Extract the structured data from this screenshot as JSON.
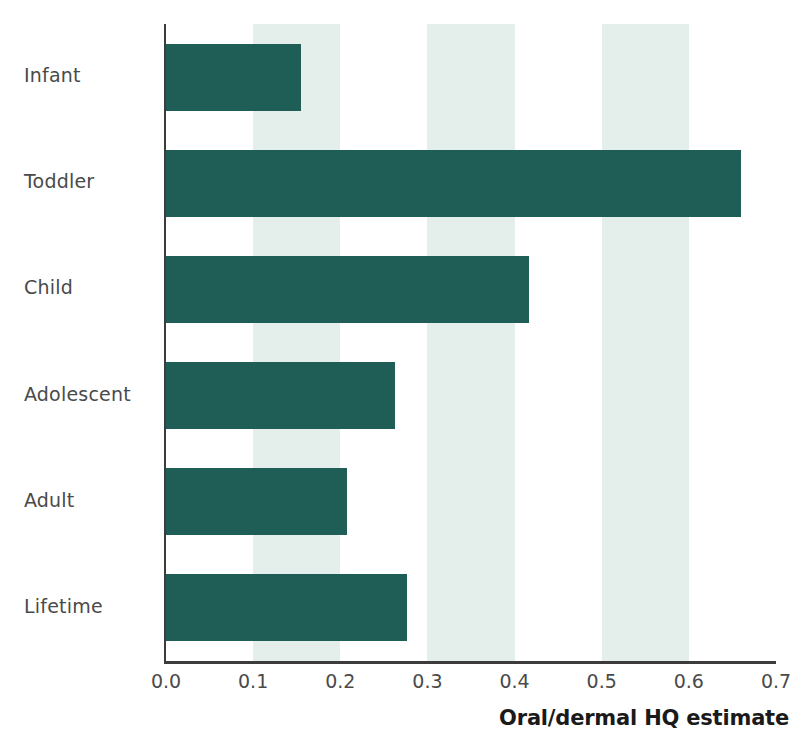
{
  "chart_data": {
    "type": "bar",
    "orientation": "horizontal",
    "title": "",
    "subtitle": "",
    "categories": [
      "Infant",
      "Toddler",
      "Child",
      "Adolescent",
      "Adult",
      "Lifetime"
    ],
    "values": [
      0.155,
      0.66,
      0.417,
      0.263,
      0.208,
      0.276
    ],
    "series": [
      {
        "name": "Oral/dermal HQ estimate",
        "values": [
          0.155,
          0.66,
          0.417,
          0.263,
          0.208,
          0.276
        ]
      }
    ],
    "xlabel": "Oral/dermal HQ estimate",
    "ylabel": "",
    "xlim": [
      0.0,
      0.7
    ],
    "xticks": [
      0.0,
      0.1,
      0.2,
      0.3,
      0.4,
      0.5,
      0.6,
      0.7
    ],
    "xtick_labels": [
      "0.0",
      "0.1",
      "0.2",
      "0.3",
      "0.4",
      "0.5",
      "0.6",
      "0.7"
    ],
    "grid": "alternating-vertical-bands",
    "band_ranges": [
      [
        0.1,
        0.2
      ],
      [
        0.3,
        0.4
      ],
      [
        0.5,
        0.6
      ]
    ],
    "legend": "none",
    "colors": {
      "bar": "#1e5e56",
      "band": "#dfece8",
      "axis": "#3c3c3c",
      "label_text": "#4a4a4a",
      "title_text": "#1a1a1a",
      "background": "#ffffff"
    }
  }
}
